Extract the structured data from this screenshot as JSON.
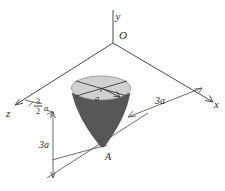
{
  "figure": {
    "background_color": "#ffffff",
    "axes": {
      "origin_label": "O",
      "x_label": "x",
      "y_label": "y",
      "z_label": "z",
      "axis_color": "#4a4a4a"
    },
    "solid": {
      "name": "cone",
      "body_color": "#575757",
      "top_face_color": "#d0d0d0",
      "top_face_edge_color": "#808080",
      "apex_label": "A"
    },
    "dimensions": [
      {
        "id": "x-offset",
        "label": "3a",
        "value": "3a",
        "axis": "x",
        "description": "distance along x-axis from cone center line to origin side"
      },
      {
        "id": "z-offset",
        "label_numerator": "3",
        "label_denominator": "2",
        "label_unit": "a",
        "value": "3/2 a",
        "axis": "z",
        "description": "distance along z-axis to cone center line"
      },
      {
        "id": "depth",
        "label": "3a",
        "value": "3a",
        "axis": "y",
        "description": "vertical drop from xz-plane down to apex A"
      },
      {
        "id": "radius",
        "label": "a",
        "value": "a",
        "description": "radius of circular top face of cone"
      }
    ]
  }
}
